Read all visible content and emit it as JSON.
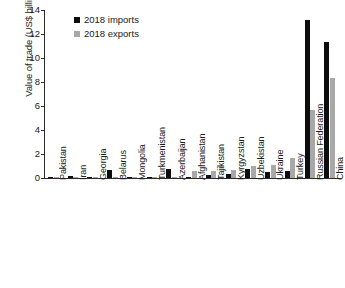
{
  "chart_data": {
    "type": "bar",
    "title": "",
    "xlabel": "",
    "ylabel": "Value of trade (US$ billions)",
    "ylim": [
      0,
      14
    ],
    "yticks": [
      0,
      2,
      4,
      6,
      8,
      10,
      12,
      14
    ],
    "grid": false,
    "legend_position": "top-left",
    "categories": [
      "Pakistan",
      "Iran",
      "Georgia",
      "Belarus",
      "Mongolia",
      "Turkmenistan",
      "Azerbaijan",
      "Afghanistan",
      "Tajikistan",
      "Kyrgyzstan",
      "Uzbekistan",
      "Ukraine",
      "Turkey",
      "Russian Federation",
      "China"
    ],
    "series": [
      {
        "name": "2018 imports",
        "color": "#0d0d0d",
        "values": [
          0.05,
          0.18,
          0.04,
          0.7,
          0.02,
          0.1,
          0.75,
          0.02,
          0.25,
          0.35,
          0.75,
          0.5,
          0.6,
          13.2,
          11.3
        ]
      },
      {
        "name": "2018 exports",
        "color": "#a8a8a8",
        "values": [
          0.03,
          0.03,
          0.03,
          0.05,
          0.02,
          0.08,
          0.12,
          0.55,
          0.6,
          0.65,
          1.0,
          1.1,
          1.65,
          5.7,
          8.3
        ]
      }
    ]
  },
  "legend": {
    "items": [
      {
        "label": "2018 imports",
        "color": "#0d0d0d"
      },
      {
        "label": "2018 exports",
        "color": "#a8a8a8"
      }
    ]
  }
}
